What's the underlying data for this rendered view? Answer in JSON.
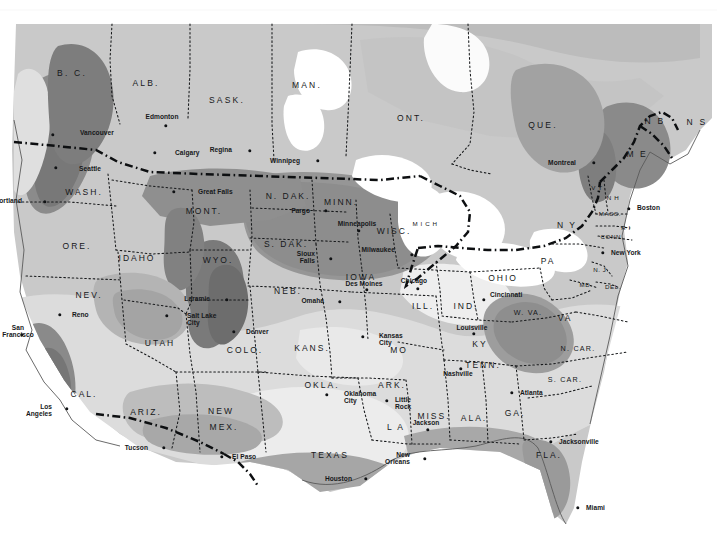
{
  "map": {
    "title": "Climate zone map of the United States and southern Canada",
    "type": "choropleth-shaded-zone-map",
    "projection_note": "conic, North America",
    "background_color": "#ffffff",
    "shade_legend": [
      {
        "name": "zone-lightest",
        "color": "#e8e8e8"
      },
      {
        "name": "zone-light",
        "color": "#d4d4d4"
      },
      {
        "name": "zone-mid",
        "color": "#bdbdbd"
      },
      {
        "name": "zone-mid-dark",
        "color": "#a3a3a3"
      },
      {
        "name": "zone-dark",
        "color": "#8a8a8a"
      },
      {
        "name": "zone-darkest",
        "color": "#6f6f6f"
      },
      {
        "name": "water-white",
        "color": "#ffffff"
      }
    ],
    "border_styles": {
      "international": "thick dash-dot",
      "state": "thin dotted",
      "coastline": "thin solid"
    },
    "provinces": [
      {
        "name": "B. C.",
        "x": 72,
        "y": 73
      },
      {
        "name": "ALB.",
        "x": 146,
        "y": 83
      },
      {
        "name": "SASK.",
        "x": 227,
        "y": 100
      },
      {
        "name": "MAN.",
        "x": 307,
        "y": 85
      },
      {
        "name": "ONT.",
        "x": 411,
        "y": 118
      },
      {
        "name": "QUE.",
        "x": 543,
        "y": 125
      },
      {
        "name": "N B",
        "x": 655,
        "y": 121
      },
      {
        "name": "N S",
        "x": 697,
        "y": 122
      }
    ],
    "states": [
      {
        "name": "WASH.",
        "x": 84,
        "y": 192,
        "size": "n"
      },
      {
        "name": "ORE.",
        "x": 77,
        "y": 246,
        "size": "n"
      },
      {
        "name": "IDAHO",
        "x": 137,
        "y": 258,
        "size": "n"
      },
      {
        "name": "MONT.",
        "x": 204,
        "y": 211,
        "size": "n"
      },
      {
        "name": "WYO.",
        "x": 218,
        "y": 260,
        "size": "n"
      },
      {
        "name": "N. DAK.",
        "x": 288,
        "y": 196,
        "size": "n"
      },
      {
        "name": "S. DAK.",
        "x": 286,
        "y": 244,
        "size": "n"
      },
      {
        "name": "MINN.",
        "x": 341,
        "y": 202,
        "size": "n"
      },
      {
        "name": "WISC.",
        "x": 394,
        "y": 231,
        "size": "n"
      },
      {
        "name": "M I C H",
        "x": 425,
        "y": 224,
        "size": "xs"
      },
      {
        "name": "IOWA",
        "x": 361,
        "y": 277,
        "size": "n"
      },
      {
        "name": "NEB.",
        "x": 288,
        "y": 291,
        "size": "n"
      },
      {
        "name": "NEV.",
        "x": 89,
        "y": 295,
        "size": "n"
      },
      {
        "name": "UTAH",
        "x": 160,
        "y": 343,
        "size": "n"
      },
      {
        "name": "COLO.",
        "x": 245,
        "y": 350,
        "size": "n"
      },
      {
        "name": "KANS.",
        "x": 312,
        "y": 348,
        "size": "n"
      },
      {
        "name": "MO",
        "x": 399,
        "y": 350,
        "size": "n"
      },
      {
        "name": "ILL.",
        "x": 423,
        "y": 306,
        "size": "n"
      },
      {
        "name": "IND.",
        "x": 466,
        "y": 306,
        "size": "n"
      },
      {
        "name": "OHIO",
        "x": 503,
        "y": 278,
        "size": "n"
      },
      {
        "name": "PA",
        "x": 548,
        "y": 261,
        "size": "n"
      },
      {
        "name": "N Y",
        "x": 567,
        "y": 225,
        "size": "n"
      },
      {
        "name": "V T",
        "x": 597,
        "y": 188,
        "size": "xs"
      },
      {
        "name": "N H",
        "x": 613,
        "y": 198,
        "size": "xs"
      },
      {
        "name": "MASS.",
        "x": 610,
        "y": 214,
        "size": "xs"
      },
      {
        "name": "R I",
        "x": 626,
        "y": 228,
        "size": "xs"
      },
      {
        "name": "CONN.",
        "x": 612,
        "y": 237,
        "size": "xs"
      },
      {
        "name": "N. J.",
        "x": 601,
        "y": 270,
        "size": "xs"
      },
      {
        "name": "DEL.",
        "x": 613,
        "y": 287,
        "size": "xs"
      },
      {
        "name": "MD.",
        "x": 586,
        "y": 285,
        "size": "xs"
      },
      {
        "name": "W. VA.",
        "x": 528,
        "y": 313,
        "size": "sm"
      },
      {
        "name": "VA",
        "x": 565,
        "y": 318,
        "size": "n"
      },
      {
        "name": "N. CAR.",
        "x": 578,
        "y": 349,
        "size": "sm"
      },
      {
        "name": "S. CAR.",
        "x": 565,
        "y": 380,
        "size": "sm"
      },
      {
        "name": "KY",
        "x": 480,
        "y": 344,
        "size": "n"
      },
      {
        "name": "TENN.",
        "x": 483,
        "y": 365,
        "size": "n"
      },
      {
        "name": "ARK.",
        "x": 392,
        "y": 385,
        "size": "n"
      },
      {
        "name": "MISS.",
        "x": 434,
        "y": 416,
        "size": "n"
      },
      {
        "name": "ALA.",
        "x": 474,
        "y": 418,
        "size": "n"
      },
      {
        "name": "GA.",
        "x": 515,
        "y": 413,
        "size": "n"
      },
      {
        "name": "FLA.",
        "x": 549,
        "y": 455,
        "size": "n"
      },
      {
        "name": "L A",
        "x": 396,
        "y": 427,
        "size": "n"
      },
      {
        "name": "OKLA.",
        "x": 322,
        "y": 385,
        "size": "n"
      },
      {
        "name": "TEXAS",
        "x": 330,
        "y": 455,
        "size": "n"
      },
      {
        "name": "NEW",
        "x": 221,
        "y": 411,
        "size": "n"
      },
      {
        "name": "MEX.",
        "x": 224,
        "y": 427,
        "size": "n"
      },
      {
        "name": "ARIZ.",
        "x": 146,
        "y": 412,
        "size": "n"
      },
      {
        "name": "CAL.",
        "x": 84,
        "y": 394,
        "size": "n"
      },
      {
        "name": "M E",
        "x": 637,
        "y": 154,
        "size": "n"
      }
    ],
    "cities": [
      {
        "name": "Vancouver",
        "dot_x": 53,
        "dot_y": 135,
        "label_x": 80,
        "label_y": 133,
        "align": "left"
      },
      {
        "name": "Seattle",
        "dot_x": 56,
        "dot_y": 168,
        "label_x": 79,
        "label_y": 169,
        "align": "left"
      },
      {
        "name": "Portland",
        "dot_x": 45,
        "dot_y": 202,
        "label_x": 22,
        "label_y": 201,
        "align": "right"
      },
      {
        "name": "Edmonton",
        "dot_x": 166,
        "dot_y": 126,
        "label_x": 162,
        "label_y": 117,
        "align": "center"
      },
      {
        "name": "Calgary",
        "dot_x": 155,
        "dot_y": 153,
        "label_x": 175,
        "label_y": 153,
        "align": "left"
      },
      {
        "name": "Regina",
        "dot_x": 250,
        "dot_y": 151,
        "label_x": 232,
        "label_y": 150,
        "align": "right"
      },
      {
        "name": "Winnipeg",
        "dot_x": 318,
        "dot_y": 161,
        "label_x": 300,
        "label_y": 161,
        "align": "right"
      },
      {
        "name": "Great Falls",
        "dot_x": 174,
        "dot_y": 192,
        "label_x": 198,
        "label_y": 192,
        "align": "left"
      },
      {
        "name": "Fargo",
        "dot_x": 326,
        "dot_y": 211,
        "label_x": 310,
        "label_y": 211,
        "align": "right"
      },
      {
        "name": "Minneapolis",
        "dot_x": 359,
        "dot_y": 231,
        "label_x": 357,
        "label_y": 224,
        "align": "center"
      },
      {
        "name": "Milwaukee",
        "dot_x": 412,
        "dot_y": 255,
        "label_x": 395,
        "label_y": 250,
        "align": "right"
      },
      {
        "name": "Sioux\nFalls",
        "dot_x": 331,
        "dot_y": 259,
        "label_x": 315,
        "label_y": 258,
        "align": "right"
      },
      {
        "name": "Des Moines",
        "dot_x": 367,
        "dot_y": 290,
        "label_x": 364,
        "label_y": 284,
        "align": "center"
      },
      {
        "name": "Omaha",
        "dot_x": 340,
        "dot_y": 302,
        "label_x": 324,
        "label_y": 301,
        "align": "right"
      },
      {
        "name": "Chicago",
        "dot_x": 418,
        "dot_y": 289,
        "label_x": 414,
        "label_y": 281,
        "align": "center"
      },
      {
        "name": "Cincinnati",
        "dot_x": 484,
        "dot_y": 300,
        "label_x": 490,
        "label_y": 295,
        "align": "left"
      },
      {
        "name": "Laramie",
        "dot_x": 227,
        "dot_y": 300,
        "label_x": 210,
        "label_y": 299,
        "align": "right"
      },
      {
        "name": "Denver",
        "dot_x": 234,
        "dot_y": 332,
        "label_x": 246,
        "label_y": 332,
        "align": "left"
      },
      {
        "name": "Salt Lake\nCity",
        "dot_x": 167,
        "dot_y": 316,
        "label_x": 187,
        "label_y": 320,
        "align": "left"
      },
      {
        "name": "Reno",
        "dot_x": 60,
        "dot_y": 315,
        "label_x": 72,
        "label_y": 315,
        "align": "left"
      },
      {
        "name": "San\nFrancisco",
        "dot_x": 22,
        "dot_y": 335,
        "label_x": 18,
        "label_y": 332,
        "align": "center"
      },
      {
        "name": "Los\nAngeles",
        "dot_x": 67,
        "dot_y": 409,
        "label_x": 52,
        "label_y": 411,
        "align": "right"
      },
      {
        "name": "Tucson",
        "dot_x": 164,
        "dot_y": 448,
        "label_x": 148,
        "label_y": 448,
        "align": "right"
      },
      {
        "name": "El Paso",
        "dot_x": 222,
        "dot_y": 457,
        "label_x": 232,
        "label_y": 457,
        "align": "left"
      },
      {
        "name": "Kansas\nCity",
        "dot_x": 363,
        "dot_y": 337,
        "label_x": 379,
        "label_y": 340,
        "align": "left"
      },
      {
        "name": "Oklahoma\nCity",
        "dot_x": 327,
        "dot_y": 395,
        "label_x": 344,
        "label_y": 398,
        "align": "left"
      },
      {
        "name": "Little\nRock",
        "dot_x": 387,
        "dot_y": 401,
        "label_x": 395,
        "label_y": 404,
        "align": "left"
      },
      {
        "name": "Jackson",
        "dot_x": 428,
        "dot_y": 430,
        "label_x": 426,
        "label_y": 423,
        "align": "center"
      },
      {
        "name": "New\nOrleans",
        "dot_x": 425,
        "dot_y": 459,
        "label_x": 410,
        "label_y": 459,
        "align": "right"
      },
      {
        "name": "Houston",
        "dot_x": 366,
        "dot_y": 479,
        "label_x": 352,
        "label_y": 479,
        "align": "right"
      },
      {
        "name": "Nashville",
        "dot_x": 461,
        "dot_y": 369,
        "label_x": 458,
        "label_y": 374,
        "align": "center"
      },
      {
        "name": "Louisville",
        "dot_x": 474,
        "dot_y": 334,
        "label_x": 472,
        "label_y": 328,
        "align": "center"
      },
      {
        "name": "Atlanta",
        "dot_x": 512,
        "dot_y": 393,
        "label_x": 520,
        "label_y": 393,
        "align": "left"
      },
      {
        "name": "Jacksonville",
        "dot_x": 551,
        "dot_y": 442,
        "label_x": 559,
        "label_y": 442,
        "align": "left"
      },
      {
        "name": "Miami",
        "dot_x": 578,
        "dot_y": 508,
        "label_x": 586,
        "label_y": 508,
        "align": "left"
      },
      {
        "name": "Montreal",
        "dot_x": 594,
        "dot_y": 163,
        "label_x": 576,
        "label_y": 163,
        "align": "right"
      },
      {
        "name": "Boston",
        "dot_x": 629,
        "dot_y": 209,
        "label_x": 637,
        "label_y": 208,
        "align": "left"
      },
      {
        "name": "New York",
        "dot_x": 603,
        "dot_y": 253,
        "label_x": 611,
        "label_y": 253,
        "align": "left"
      }
    ]
  }
}
